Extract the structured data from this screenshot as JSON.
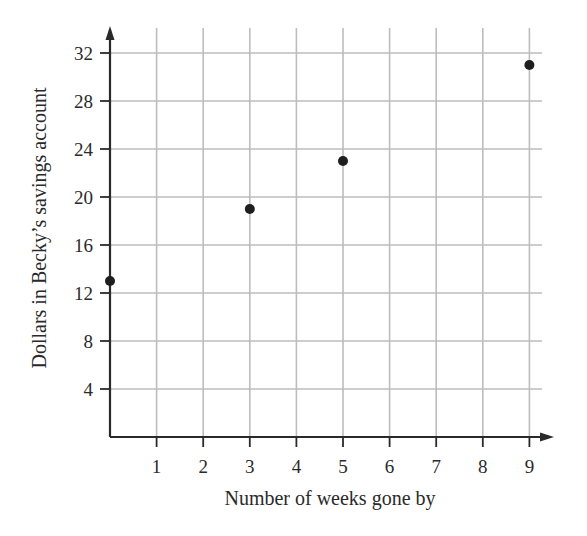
{
  "chart_data": {
    "type": "scatter",
    "title": "",
    "xlabel": "Number of weeks gone by",
    "ylabel": "Dollars in Becky’s savings account",
    "x_ticks": [
      1,
      2,
      3,
      4,
      5,
      6,
      7,
      8,
      9
    ],
    "y_ticks": [
      4,
      8,
      12,
      16,
      20,
      24,
      28,
      32
    ],
    "xlim": [
      0,
      9.4
    ],
    "ylim": [
      0,
      33.5
    ],
    "grid": true,
    "legend": null,
    "series": [
      {
        "name": "Savings",
        "points": [
          {
            "x": 0,
            "y": 13
          },
          {
            "x": 3,
            "y": 19
          },
          {
            "x": 5,
            "y": 23
          },
          {
            "x": 9,
            "y": 31
          }
        ]
      }
    ],
    "colors": {
      "grid": "#bdbdbd",
      "axis": "#2a2a2a",
      "points": "#1e1e1e"
    }
  },
  "layout": {
    "origin_px": [
      110,
      437
    ],
    "x_unit_px": 46.6,
    "y_unit_px": 12.0,
    "plot_right_px": 552,
    "plot_top_px": 28
  }
}
